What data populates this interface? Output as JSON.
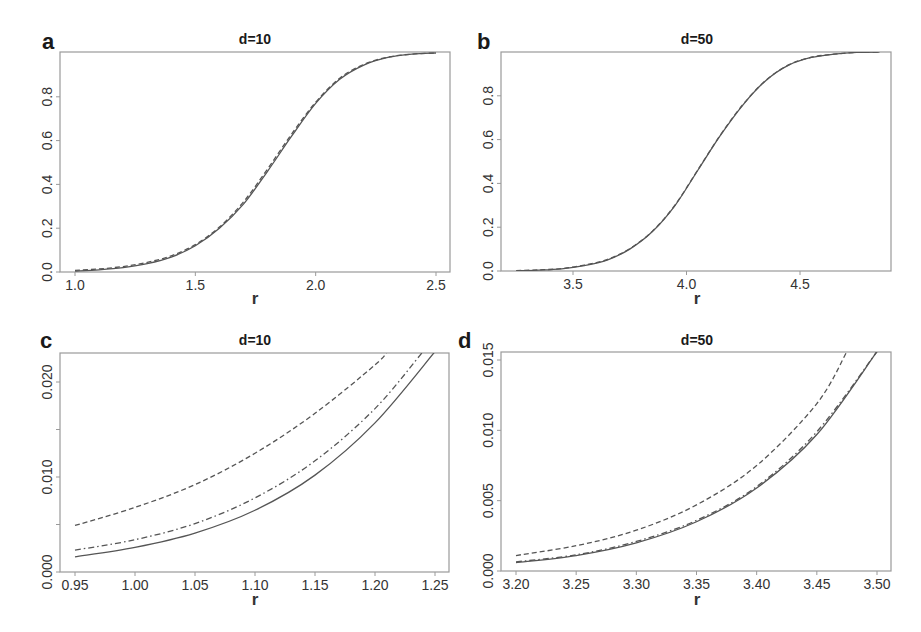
{
  "figure": {
    "background": "#ffffff",
    "line_color": "#555555"
  },
  "chart_data": [
    {
      "id": "a",
      "type": "line",
      "panel_letter": "a",
      "title": "d=10",
      "xlabel": "r",
      "ylabel": "",
      "xlim": [
        0.96,
        2.56
      ],
      "ylim": [
        0.0,
        1.0
      ],
      "xticks": [
        1.0,
        1.5,
        2.0,
        2.5
      ],
      "xtick_labels": [
        "1.0",
        "1.5",
        "2.0",
        "2.5"
      ],
      "yticks": [
        0.0,
        0.2,
        0.4,
        0.6,
        0.8
      ],
      "ytick_labels": [
        "0.0",
        "0.2",
        "0.4",
        "0.6",
        "0.8"
      ],
      "grid": false,
      "legend": null,
      "series": [
        {
          "name": "solid",
          "style": "solid",
          "x": [
            1.0,
            1.1,
            1.2,
            1.3,
            1.4,
            1.5,
            1.6,
            1.7,
            1.8,
            1.9,
            2.0,
            2.1,
            2.2,
            2.3,
            2.4,
            2.5
          ],
          "y": [
            0.004,
            0.01,
            0.02,
            0.038,
            0.068,
            0.12,
            0.2,
            0.31,
            0.46,
            0.62,
            0.77,
            0.88,
            0.945,
            0.98,
            0.995,
            1.0
          ]
        },
        {
          "name": "dashed",
          "style": "dashed",
          "x": [
            1.0,
            1.1,
            1.2,
            1.3,
            1.4,
            1.5,
            1.6,
            1.7,
            1.8,
            1.9,
            2.0,
            2.1,
            2.2,
            2.3,
            2.4,
            2.5
          ],
          "y": [
            0.007,
            0.014,
            0.025,
            0.044,
            0.074,
            0.125,
            0.205,
            0.32,
            0.47,
            0.63,
            0.775,
            0.885,
            0.948,
            0.981,
            0.995,
            1.0
          ]
        }
      ]
    },
    {
      "id": "b",
      "type": "line",
      "panel_letter": "b",
      "title": "d=50",
      "xlabel": "r",
      "ylabel": "",
      "xlim": [
        3.18,
        4.9
      ],
      "ylim": [
        0.0,
        1.0
      ],
      "xticks": [
        3.5,
        4.0,
        4.5
      ],
      "xtick_labels": [
        "3.5",
        "4.0",
        "4.5"
      ],
      "yticks": [
        0.0,
        0.2,
        0.4,
        0.6,
        0.8
      ],
      "ytick_labels": [
        "0.0",
        "0.2",
        "0.4",
        "0.6",
        "0.8"
      ],
      "grid": false,
      "legend": null,
      "series": [
        {
          "name": "solid",
          "style": "solid",
          "x": [
            3.25,
            3.35,
            3.45,
            3.55,
            3.65,
            3.75,
            3.85,
            3.95,
            4.05,
            4.15,
            4.25,
            4.35,
            4.45,
            4.55,
            4.65,
            4.75,
            4.85
          ],
          "y": [
            0.001,
            0.004,
            0.01,
            0.025,
            0.05,
            0.1,
            0.18,
            0.3,
            0.46,
            0.62,
            0.76,
            0.87,
            0.94,
            0.975,
            0.99,
            0.998,
            1.0
          ]
        },
        {
          "name": "dashed",
          "style": "dashed",
          "x": [
            3.25,
            3.35,
            3.45,
            3.55,
            3.65,
            3.75,
            3.85,
            3.95,
            4.05,
            4.15,
            4.25,
            4.35,
            4.45,
            4.55,
            4.65,
            4.75,
            4.85
          ],
          "y": [
            0.0015,
            0.005,
            0.011,
            0.027,
            0.052,
            0.102,
            0.182,
            0.302,
            0.462,
            0.622,
            0.762,
            0.871,
            0.941,
            0.976,
            0.99,
            0.998,
            1.0
          ]
        }
      ]
    },
    {
      "id": "c",
      "type": "line",
      "panel_letter": "c",
      "title": "d=10",
      "xlabel": "r",
      "ylabel": "",
      "xlim": [
        0.9417,
        1.2583
      ],
      "ylim": [
        0.0,
        0.0231
      ],
      "xticks": [
        0.95,
        1.0,
        1.05,
        1.1,
        1.15,
        1.2,
        1.25
      ],
      "xtick_labels": [
        "0.95",
        "1.00",
        "1.05",
        "1.10",
        "1.15",
        "1.20",
        "1.25"
      ],
      "yticks": [
        0.0,
        0.005,
        0.01,
        0.015,
        0.02
      ],
      "ytick_labels": [
        "0.000",
        "",
        "0.010",
        "",
        "0.020"
      ],
      "grid": false,
      "legend": null,
      "series": [
        {
          "name": "solid",
          "style": "solid",
          "x": [
            0.95,
            1.0,
            1.05,
            1.1,
            1.15,
            1.2,
            1.25
          ],
          "y": [
            0.0016,
            0.0026,
            0.0041,
            0.0065,
            0.0102,
            0.0157,
            0.0232
          ]
        },
        {
          "name": "dashdot",
          "style": "dashdot",
          "x": [
            0.95,
            1.0,
            1.05,
            1.1,
            1.15,
            1.2,
            1.24
          ],
          "y": [
            0.0023,
            0.0034,
            0.0051,
            0.0078,
            0.0117,
            0.0172,
            0.0232
          ]
        },
        {
          "name": "dashed",
          "style": "dashed",
          "x": [
            0.95,
            1.0,
            1.05,
            1.1,
            1.15,
            1.2,
            1.21
          ],
          "y": [
            0.0049,
            0.0068,
            0.0092,
            0.0125,
            0.0167,
            0.0218,
            0.0232
          ]
        }
      ]
    },
    {
      "id": "d",
      "type": "line",
      "panel_letter": "d",
      "title": "d=50",
      "xlabel": "r",
      "ylabel": "",
      "xlim": [
        3.1875,
        3.5117
      ],
      "ylim": [
        0.0,
        0.0156
      ],
      "xticks": [
        3.2,
        3.25,
        3.3,
        3.35,
        3.4,
        3.45,
        3.5
      ],
      "xtick_labels": [
        "3.20",
        "3.25",
        "3.30",
        "3.35",
        "3.40",
        "3.45",
        "3.50"
      ],
      "yticks": [
        0.0,
        0.005,
        0.01,
        0.015
      ],
      "ytick_labels": [
        "0.000",
        "0.005",
        "0.010",
        "0.015"
      ],
      "grid": false,
      "legend": null,
      "series": [
        {
          "name": "solid",
          "style": "solid",
          "x": [
            3.2,
            3.25,
            3.3,
            3.35,
            3.4,
            3.45,
            3.5
          ],
          "y": [
            0.0006,
            0.0011,
            0.002,
            0.0035,
            0.0059,
            0.0097,
            0.0156
          ]
        },
        {
          "name": "dashdot",
          "style": "dashdot",
          "x": [
            3.2,
            3.25,
            3.3,
            3.35,
            3.4,
            3.45,
            3.5
          ],
          "y": [
            0.00065,
            0.00115,
            0.0021,
            0.0036,
            0.006,
            0.0099,
            0.0156
          ]
        },
        {
          "name": "dashed",
          "style": "dashed",
          "x": [
            3.2,
            3.25,
            3.3,
            3.35,
            3.4,
            3.45,
            3.475
          ],
          "y": [
            0.0011,
            0.0018,
            0.0029,
            0.0047,
            0.0075,
            0.0119,
            0.0156
          ]
        }
      ]
    }
  ]
}
